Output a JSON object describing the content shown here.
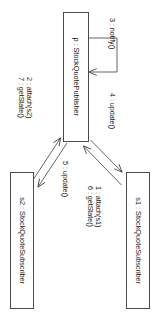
{
  "diagram": {
    "kind": "uml-collaboration-diagram",
    "pattern": "Observer",
    "orientation": "rotated-90-clockwise",
    "background_color": "#ffffff",
    "line_color": "#4a4a4a",
    "text_color": "#1a1a1a",
    "objects": [
      {
        "id": "publisher",
        "label": "p : StockQuotePublisher",
        "role": "subject"
      },
      {
        "id": "subscriber1",
        "label": "s1 : StockQuoteSubscriber",
        "role": "observer"
      },
      {
        "id": "subscriber2",
        "label": "s2 : StockQuoteSubscriber",
        "role": "observer"
      }
    ],
    "messages": [
      {
        "id": "m1",
        "line1": "1 : attach(s1)",
        "line2": "6 : getState()",
        "from": "subscriber1",
        "to": "publisher"
      },
      {
        "id": "m2",
        "line1": "2 : attach(s2)",
        "line2": "7 : getState()",
        "from": "subscriber2",
        "to": "publisher"
      },
      {
        "id": "m3",
        "line1": "3 : notify()",
        "from": "publisher",
        "to": "publisher"
      },
      {
        "id": "m4",
        "line1": "4 : update()",
        "from": "publisher",
        "to": "subscriber1"
      },
      {
        "id": "m5",
        "line1": "5 : update()",
        "from": "publisher",
        "to": "subscriber2"
      }
    ]
  }
}
